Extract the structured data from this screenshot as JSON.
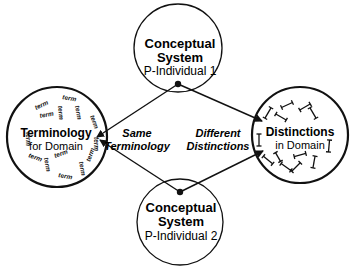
{
  "nodes": {
    "top": {
      "line1": "Conceptual",
      "line2": "System",
      "line3": "P-Individual 1"
    },
    "bottom": {
      "line1": "Conceptual",
      "line2": "System",
      "line3": "P-Individual 2"
    },
    "left": {
      "line1": "Terminology",
      "line2": "for Domain",
      "term_label": "term"
    },
    "right": {
      "line1": "Distinctions",
      "line2": "in Domain"
    }
  },
  "edge_labels": {
    "left": {
      "line1": "Same",
      "line2": "Terminology"
    },
    "right": {
      "line1": "Different",
      "line2": "Distinctions"
    }
  },
  "colors": {
    "stroke": "#111111",
    "background": "#ffffff"
  }
}
